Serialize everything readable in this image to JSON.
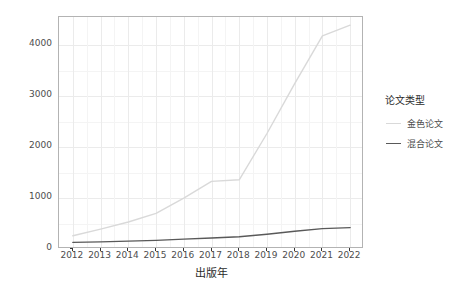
{
  "chart_data": {
    "type": "line",
    "title": "",
    "xlabel": "出版年",
    "ylabel": "APC费用（万元）",
    "x": [
      2012,
      2013,
      2014,
      2015,
      2016,
      2017,
      2018,
      2019,
      2020,
      2021,
      2022
    ],
    "xtick_labels": [
      "2012",
      "2013",
      "2014",
      "2015",
      "2016",
      "2017",
      "2018",
      "2019",
      "2020",
      "2021",
      "2022"
    ],
    "ytick_labels": [
      "0",
      "1000",
      "2000",
      "3000",
      "4000"
    ],
    "ytick_values": [
      0,
      1000,
      2000,
      3000,
      4000
    ],
    "xlim": [
      2011.5,
      2022.5
    ],
    "ylim": [
      0,
      4560
    ],
    "grid": true,
    "legend_position": "right",
    "legend_title": "论文类型",
    "series": [
      {
        "name": "金色论文",
        "color": "#d9d9d9",
        "values": [
          260,
          390,
          530,
          700,
          1000,
          1330,
          1360,
          2270,
          3250,
          4190,
          4400
        ]
      },
      {
        "name": "混合论文",
        "color": "#595959",
        "values": [
          130,
          140,
          155,
          170,
          195,
          215,
          240,
          290,
          350,
          400,
          420
        ]
      }
    ]
  },
  "axes": {
    "x_title": "出版年",
    "y_title": "APC费用（万元）"
  },
  "legend": {
    "title": "论文类型",
    "items": [
      {
        "label": "金色论文",
        "color": "#d9d9d9"
      },
      {
        "label": "混合论文",
        "color": "#595959"
      }
    ]
  }
}
